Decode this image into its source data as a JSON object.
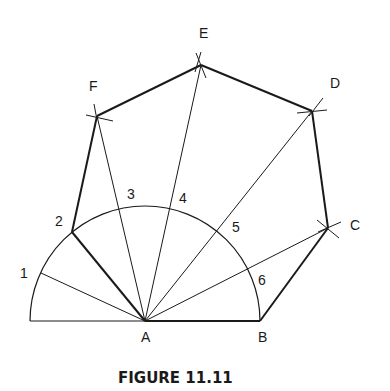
{
  "figure": {
    "caption": "FIGURE 11.11",
    "colors": {
      "line": "#1a1a1a",
      "background": "#ffffff"
    },
    "vertices": {
      "A": {
        "label": "A",
        "x": 145,
        "y": 321
      },
      "B": {
        "label": "B",
        "x": 260,
        "y": 321
      },
      "C": {
        "label": "C",
        "x": 328,
        "y": 228
      },
      "D": {
        "label": "D",
        "x": 312,
        "y": 111
      },
      "E": {
        "label": "E",
        "x": 201,
        "y": 65
      },
      "F": {
        "label": "F",
        "x": 97,
        "y": 116
      }
    },
    "arc_points": [
      {
        "label": "1",
        "x": 41,
        "y": 273
      },
      {
        "label": "2",
        "x": 72,
        "y": 232
      },
      {
        "label": "3",
        "x": 119,
        "y": 207
      },
      {
        "label": "4",
        "x": 170,
        "y": 207
      },
      {
        "label": "5",
        "x": 217,
        "y": 230
      },
      {
        "label": "6",
        "x": 248,
        "y": 270
      }
    ],
    "arc": {
      "center": "A",
      "radius": 115,
      "divisions": 7
    }
  }
}
